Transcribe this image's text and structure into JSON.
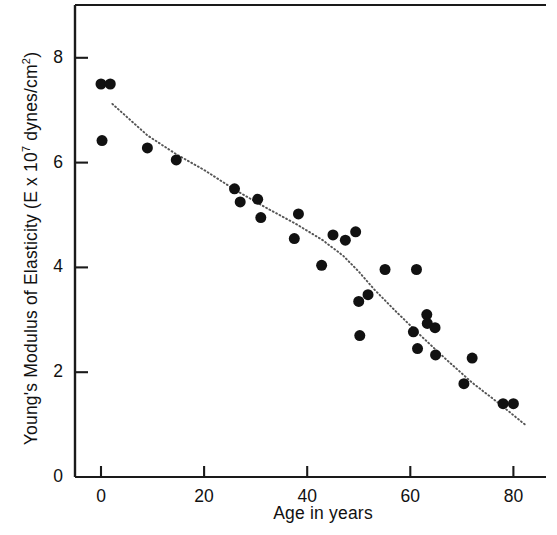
{
  "chart_data": {
    "type": "scatter",
    "title": "",
    "xlabel": "Age in years",
    "ylabel": "Young's Modulus of Elasticity (E x 10⁷ dynes/cm²)",
    "ylabel_parts": {
      "prefix": "Young's Modulus of Elasticity (E x 10",
      "exponent": "7",
      "suffix": " dynes/cm",
      "unit_exponent": "2",
      "close": ")"
    },
    "xlim": [
      -3,
      86
    ],
    "ylim": [
      0,
      9.1
    ],
    "xticks": [
      0,
      20,
      40,
      60,
      80
    ],
    "yticks": [
      0,
      2,
      4,
      6,
      8
    ],
    "xtick_labels": [
      "0",
      "20",
      "40",
      "60",
      "80"
    ],
    "ytick_labels": [
      "0",
      "2",
      "4",
      "6",
      "8"
    ],
    "grid": false,
    "legend": false,
    "marker": "filled-circle",
    "marker_color": "#111111",
    "marker_size": 11,
    "axis_color": "#1a1a1a",
    "frame": {
      "top_border": true,
      "left_border": true,
      "bottom_border": true,
      "right_border": false
    },
    "points": [
      {
        "x": 0.0,
        "y": 7.5
      },
      {
        "x": 1.8,
        "y": 7.5
      },
      {
        "x": 0.2,
        "y": 6.42
      },
      {
        "x": 9.0,
        "y": 6.28
      },
      {
        "x": 14.6,
        "y": 6.05
      },
      {
        "x": 25.9,
        "y": 5.5
      },
      {
        "x": 27.0,
        "y": 5.25
      },
      {
        "x": 30.4,
        "y": 5.3
      },
      {
        "x": 31.0,
        "y": 4.95
      },
      {
        "x": 38.3,
        "y": 5.02
      },
      {
        "x": 37.5,
        "y": 4.55
      },
      {
        "x": 42.8,
        "y": 4.04
      },
      {
        "x": 45.0,
        "y": 4.62
      },
      {
        "x": 47.4,
        "y": 4.52
      },
      {
        "x": 49.4,
        "y": 4.68
      },
      {
        "x": 50.0,
        "y": 3.35
      },
      {
        "x": 51.8,
        "y": 3.48
      },
      {
        "x": 50.2,
        "y": 2.7
      },
      {
        "x": 55.1,
        "y": 3.96
      },
      {
        "x": 60.6,
        "y": 2.77
      },
      {
        "x": 61.2,
        "y": 3.96
      },
      {
        "x": 61.4,
        "y": 2.45
      },
      {
        "x": 63.2,
        "y": 3.1
      },
      {
        "x": 63.3,
        "y": 2.93
      },
      {
        "x": 64.8,
        "y": 2.85
      },
      {
        "x": 64.9,
        "y": 2.33
      },
      {
        "x": 70.4,
        "y": 1.78
      },
      {
        "x": 72.0,
        "y": 2.27
      },
      {
        "x": 78.0,
        "y": 1.4
      },
      {
        "x": 80.0,
        "y": 1.4
      }
    ],
    "trend_line": {
      "style": "dotted",
      "color": "#555555",
      "points": [
        {
          "x": 2.2,
          "y": 7.12
        },
        {
          "x": 9.0,
          "y": 6.52
        },
        {
          "x": 14.6,
          "y": 6.16
        },
        {
          "x": 20.0,
          "y": 5.86
        },
        {
          "x": 26.0,
          "y": 5.48
        },
        {
          "x": 32.0,
          "y": 5.14
        },
        {
          "x": 38.0,
          "y": 4.82
        },
        {
          "x": 43.0,
          "y": 4.52
        },
        {
          "x": 47.0,
          "y": 4.22
        },
        {
          "x": 50.0,
          "y": 3.92
        },
        {
          "x": 53.0,
          "y": 3.58
        },
        {
          "x": 57.0,
          "y": 3.18
        },
        {
          "x": 62.0,
          "y": 2.7
        },
        {
          "x": 67.0,
          "y": 2.24
        },
        {
          "x": 72.0,
          "y": 1.8
        },
        {
          "x": 77.0,
          "y": 1.42
        },
        {
          "x": 82.5,
          "y": 0.98
        }
      ]
    }
  }
}
